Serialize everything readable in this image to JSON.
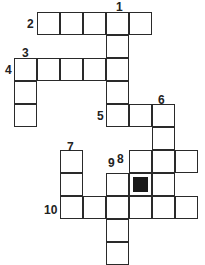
{
  "puzzle": {
    "type": "crossword",
    "cell_size": 23,
    "origin": {
      "x": 15,
      "y": 13
    },
    "cells": [
      {
        "r": 0,
        "c": 1
      },
      {
        "r": 0,
        "c": 2
      },
      {
        "r": 0,
        "c": 3
      },
      {
        "r": 0,
        "c": 4
      },
      {
        "r": 0,
        "c": 5
      },
      {
        "r": 1,
        "c": 4
      },
      {
        "r": 2,
        "c": 0
      },
      {
        "r": 2,
        "c": 1
      },
      {
        "r": 2,
        "c": 2
      },
      {
        "r": 2,
        "c": 3
      },
      {
        "r": 2,
        "c": 4
      },
      {
        "r": 3,
        "c": 0
      },
      {
        "r": 3,
        "c": 4
      },
      {
        "r": 4,
        "c": 0
      },
      {
        "r": 4,
        "c": 4
      },
      {
        "r": 4,
        "c": 5
      },
      {
        "r": 4,
        "c": 6
      },
      {
        "r": 5,
        "c": 6
      },
      {
        "r": 6,
        "c": 2
      },
      {
        "r": 6,
        "c": 5
      },
      {
        "r": 6,
        "c": 6
      },
      {
        "r": 6,
        "c": 7
      },
      {
        "r": 7,
        "c": 2
      },
      {
        "r": 7,
        "c": 4
      },
      {
        "r": 7,
        "c": 5,
        "black": true
      },
      {
        "r": 7,
        "c": 6
      },
      {
        "r": 8,
        "c": 2
      },
      {
        "r": 8,
        "c": 3
      },
      {
        "r": 8,
        "c": 4
      },
      {
        "r": 8,
        "c": 5
      },
      {
        "r": 8,
        "c": 6
      },
      {
        "r": 8,
        "c": 7
      },
      {
        "r": 9,
        "c": 4
      },
      {
        "r": 10,
        "c": 4
      }
    ],
    "numbers": [
      {
        "label": "1",
        "x": 116,
        "y": 1
      },
      {
        "label": "2",
        "x": 27,
        "y": 18
      },
      {
        "label": "3",
        "x": 22,
        "y": 47
      },
      {
        "label": "4",
        "x": 5,
        "y": 64
      },
      {
        "label": "5",
        "x": 97,
        "y": 110
      },
      {
        "label": "6",
        "x": 158,
        "y": 94
      },
      {
        "label": "7",
        "x": 67,
        "y": 141
      },
      {
        "label": "9",
        "x": 108,
        "y": 157
      },
      {
        "label": "8",
        "x": 117,
        "y": 153
      },
      {
        "label": "10",
        "x": 44,
        "y": 204
      }
    ]
  }
}
